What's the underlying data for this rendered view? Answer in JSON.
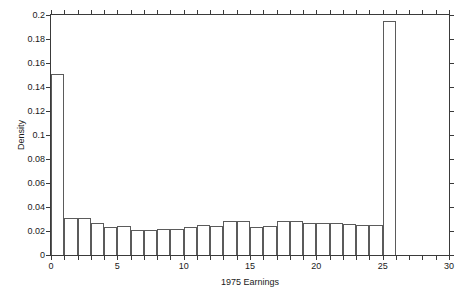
{
  "chart_data": {
    "type": "bar",
    "title": "",
    "xlabel": "1975 Earnings",
    "ylabel": "Density",
    "xlim": [
      0,
      30
    ],
    "ylim": [
      0,
      0.2
    ],
    "xticks": [
      0,
      5,
      10,
      15,
      20,
      25,
      30
    ],
    "xticklabels": [
      "0",
      "5",
      "10",
      "15",
      "20",
      "25",
      "30"
    ],
    "xminorticks": [
      1,
      2,
      3,
      4,
      6,
      7,
      8,
      9,
      11,
      12,
      13,
      14,
      16,
      17,
      18,
      19,
      21,
      22,
      23,
      24,
      26,
      27,
      28,
      29
    ],
    "yticks": [
      0,
      0.02,
      0.04,
      0.06,
      0.08,
      0.1,
      0.12,
      0.14,
      0.16,
      0.18,
      0.2
    ],
    "yticklabels": [
      "0",
      "0.02",
      "0.04",
      "0.06",
      "0.08",
      "0.1",
      "0.12",
      "0.14",
      "0.16",
      "0.18",
      "0.2"
    ],
    "grid": false,
    "legend": null,
    "bin_width": 1,
    "bin_edges": [
      0,
      1,
      2,
      3,
      4,
      5,
      6,
      7,
      8,
      9,
      10,
      11,
      12,
      13,
      14,
      15,
      16,
      17,
      18,
      19,
      20,
      21,
      22,
      23,
      24,
      25,
      26
    ],
    "categories": [
      "0-1",
      "1-2",
      "2-3",
      "3-4",
      "4-5",
      "5-6",
      "6-7",
      "7-8",
      "8-9",
      "9-10",
      "10-11",
      "11-12",
      "12-13",
      "13-14",
      "14-15",
      "15-16",
      "16-17",
      "17-18",
      "18-19",
      "19-20",
      "20-21",
      "21-22",
      "22-23",
      "23-24",
      "24-25",
      "25-26"
    ],
    "values": [
      0.151,
      0.031,
      0.031,
      0.027,
      0.023,
      0.024,
      0.021,
      0.021,
      0.022,
      0.022,
      0.023,
      0.025,
      0.024,
      0.028,
      0.028,
      0.023,
      0.024,
      0.028,
      0.028,
      0.027,
      0.027,
      0.027,
      0.026,
      0.025,
      0.025,
      0.195
    ],
    "series": [
      {
        "name": "Density",
        "values": [
          0.151,
          0.031,
          0.031,
          0.027,
          0.023,
          0.024,
          0.021,
          0.021,
          0.022,
          0.022,
          0.023,
          0.025,
          0.024,
          0.028,
          0.028,
          0.023,
          0.024,
          0.028,
          0.028,
          0.027,
          0.027,
          0.027,
          0.026,
          0.025,
          0.025,
          0.195
        ]
      }
    ],
    "colors": {
      "bar_edge": "#5b5b5b",
      "bar_fill": "none",
      "axis": "#3a3a3a",
      "text": "#1a1a1a",
      "background": "#ffffff"
    }
  }
}
